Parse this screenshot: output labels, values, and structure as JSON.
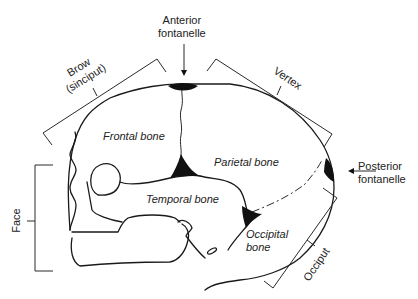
{
  "labels": {
    "anterior_fontanelle": [
      "Anterior",
      "fontanelle"
    ],
    "posterior_fontanelle": [
      "Posterior",
      "fontanelle"
    ],
    "brow": [
      "Brow",
      "(sinciput)"
    ],
    "vertex": "Vertex",
    "face": "Face",
    "occiput": "Occiput",
    "frontal_bone": "Frontal bone",
    "parietal_bone": "Parietal bone",
    "temporal_bone": "Temporal bone",
    "occipital_bone": [
      "Occipital",
      "bone"
    ]
  },
  "colors": {
    "stroke": "#1a1a1a",
    "fontanelle_fill": "#111111",
    "background": "#ffffff"
  }
}
